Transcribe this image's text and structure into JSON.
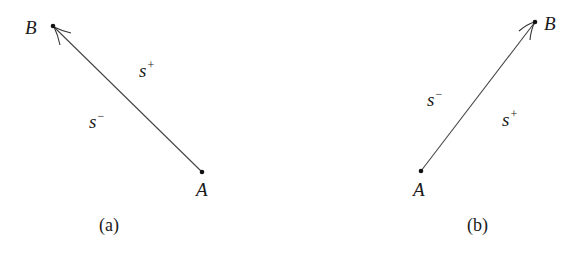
{
  "panels": [
    {
      "caption": "(a)",
      "point_start": {
        "label": "A",
        "x": 202,
        "y": 172
      },
      "point_end": {
        "label": "B",
        "x": 53,
        "y": 26
      },
      "side_labels": [
        {
          "base": "s",
          "sup": "+",
          "x": 138,
          "y": 60
        },
        {
          "base": "s",
          "sup": "−",
          "x": 88,
          "y": 112
        }
      ]
    },
    {
      "caption": "(b)",
      "point_start": {
        "label": "A",
        "x": 421,
        "y": 171
      },
      "point_end": {
        "label": "B",
        "x": 535,
        "y": 22
      },
      "side_labels": [
        {
          "base": "s",
          "sup": "−",
          "x": 426,
          "y": 88
        },
        {
          "base": "s",
          "sup": "+",
          "x": 502,
          "y": 108
        }
      ]
    }
  ],
  "colors": {
    "stroke": "#333333",
    "text": "#1a1a1a",
    "background": "#ffffff"
  }
}
